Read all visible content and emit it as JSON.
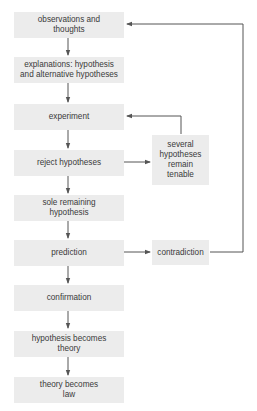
{
  "diagram": {
    "type": "flowchart",
    "colors": {
      "box_fill": "#ececec",
      "text": "#3a3a3a",
      "line": "#555555"
    },
    "main_flow": [
      {
        "id": "observations",
        "label": "observations and\nthoughts"
      },
      {
        "id": "explanations",
        "label": "explanations: hypothesis\nand alternative hypotheses"
      },
      {
        "id": "experiment",
        "label": "experiment"
      },
      {
        "id": "reject",
        "label": "reject hypotheses"
      },
      {
        "id": "sole",
        "label": "sole remaining\nhypothesis"
      },
      {
        "id": "prediction",
        "label": "prediction"
      },
      {
        "id": "confirmation",
        "label": "confirmation"
      },
      {
        "id": "becomes_theory",
        "label": "hypothesis becomes\ntheory"
      },
      {
        "id": "becomes_law",
        "label": "theory becomes\nlaw"
      }
    ],
    "side_nodes": [
      {
        "id": "several",
        "label": "several\nhypotheses\nremain\ntenable"
      },
      {
        "id": "contradiction",
        "label": "contradiction"
      }
    ],
    "edges": [
      {
        "from": "observations",
        "to": "explanations"
      },
      {
        "from": "explanations",
        "to": "experiment"
      },
      {
        "from": "experiment",
        "to": "reject"
      },
      {
        "from": "reject",
        "to": "sole"
      },
      {
        "from": "sole",
        "to": "prediction"
      },
      {
        "from": "prediction",
        "to": "confirmation"
      },
      {
        "from": "confirmation",
        "to": "becomes_theory"
      },
      {
        "from": "becomes_theory",
        "to": "becomes_law"
      },
      {
        "from": "reject",
        "to": "several"
      },
      {
        "from": "several",
        "to": "experiment"
      },
      {
        "from": "prediction",
        "to": "contradiction"
      },
      {
        "from": "contradiction",
        "to": "observations"
      }
    ]
  }
}
